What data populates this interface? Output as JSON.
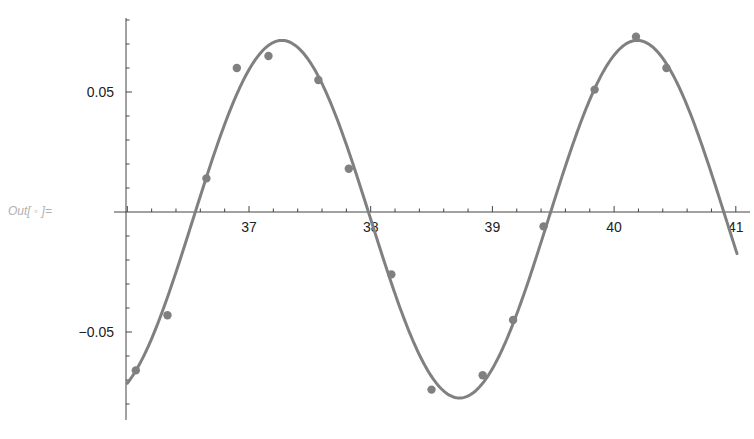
{
  "cell": {
    "out_label": "Out[ ◦ ]="
  },
  "chart_data": {
    "type": "scatter",
    "title": "",
    "xlabel": "",
    "ylabel": "",
    "xlim": [
      36.0,
      41.1
    ],
    "ylim": [
      -0.085,
      0.08
    ],
    "grid": false,
    "legend": null,
    "x_ticks": [
      37,
      38,
      39,
      40,
      41
    ],
    "x_tick_labels": [
      "37",
      "38",
      "39",
      "40",
      "41"
    ],
    "y_ticks": [
      0.05,
      -0.05
    ],
    "y_tick_labels": [
      "0.05",
      "−0.05"
    ],
    "colors": {
      "series": "#808080",
      "axis": "#444444",
      "text": "#222222",
      "out_label": "#b0b0b0"
    },
    "series": [
      {
        "name": "data",
        "kind": "points",
        "x": [
          36.07,
          36.33,
          36.65,
          36.9,
          37.16,
          37.57,
          37.82,
          38.17,
          38.5,
          38.92,
          39.17,
          39.42,
          39.84,
          40.18,
          40.43
        ],
        "y": [
          -0.066,
          -0.043,
          0.014,
          0.06,
          0.065,
          0.055,
          0.018,
          -0.026,
          -0.074,
          -0.068,
          -0.045,
          -0.006,
          0.051,
          0.073,
          0.06
        ]
      },
      {
        "name": "fit",
        "kind": "line",
        "model": "A*sin(2*pi*(x - x0)/P) + c",
        "params": {
          "A": 0.0745,
          "x0": 36.54,
          "P": 2.92,
          "c": -0.003
        },
        "x_range": [
          36.0,
          41.01
        ]
      }
    ]
  }
}
